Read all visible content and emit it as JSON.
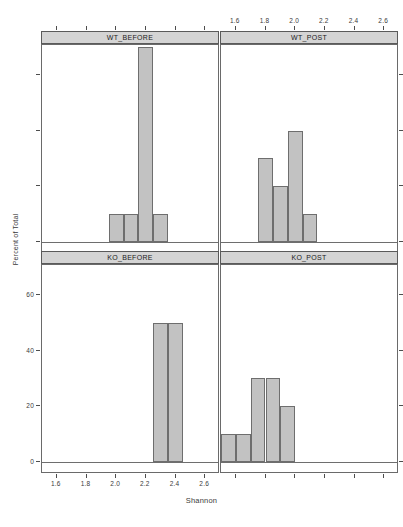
{
  "figure": {
    "xlabel": "Shannon",
    "ylabel": "Percent of Total",
    "caption": ""
  },
  "chart_data": {
    "type": "bar",
    "title": "",
    "subtitle": "",
    "xlabel": "Shannon",
    "ylabel": "Percent of Total",
    "layout": "2x2 trellis/lattice histogram panels",
    "grid": false,
    "legend": "none",
    "xlim": [
      1.5,
      2.7
    ],
    "ylim": [
      0,
      75
    ],
    "xticks": [
      "1.6",
      "1.8",
      "2.0",
      "2.2",
      "2.4",
      "2.6"
    ],
    "xtick_values": [
      1.6,
      1.8,
      2.0,
      2.2,
      2.4,
      2.6
    ],
    "yticks": [
      "0",
      "20",
      "40",
      "60"
    ],
    "ytick_values": [
      0,
      20,
      40,
      60
    ],
    "bin_width": 0.1,
    "panels": [
      {
        "name": "WT_BEFORE",
        "strip_label": "WT_BEFORE",
        "row": 0,
        "col": 0,
        "bins": [
          {
            "x0": 1.95,
            "x1": 2.05,
            "value": 10
          },
          {
            "x0": 2.05,
            "x1": 2.15,
            "value": 10
          },
          {
            "x0": 2.15,
            "x1": 2.25,
            "value": 70
          },
          {
            "x0": 2.25,
            "x1": 2.35,
            "value": 10
          }
        ]
      },
      {
        "name": "WT_POST",
        "strip_label": "WT_POST",
        "row": 0,
        "col": 1,
        "bins": [
          {
            "x0": 1.75,
            "x1": 1.85,
            "value": 30
          },
          {
            "x0": 1.85,
            "x1": 1.95,
            "value": 20
          },
          {
            "x0": 1.95,
            "x1": 2.05,
            "value": 40
          },
          {
            "x0": 2.05,
            "x1": 2.15,
            "value": 10
          }
        ]
      },
      {
        "name": "KO_BEFORE",
        "strip_label": "KO_BEFORE",
        "row": 1,
        "col": 0,
        "bins": [
          {
            "x0": 2.25,
            "x1": 2.35,
            "value": 50
          },
          {
            "x0": 2.35,
            "x1": 2.45,
            "value": 50
          }
        ]
      },
      {
        "name": "KO_POST",
        "strip_label": "KO_POST",
        "row": 1,
        "col": 1,
        "bins": [
          {
            "x0": 1.5,
            "x1": 1.6,
            "value": 10
          },
          {
            "x0": 1.6,
            "x1": 1.7,
            "value": 10
          },
          {
            "x0": 1.7,
            "x1": 1.8,
            "value": 30
          },
          {
            "x0": 1.8,
            "x1": 1.9,
            "value": 30
          },
          {
            "x0": 1.9,
            "x1": 2.0,
            "value": 20
          }
        ]
      }
    ],
    "colors": {
      "bar_fill": "#c2c2c2",
      "bar_border": "#6e6e6e",
      "strip_fill": "#d4d4d4",
      "strip_border": "#5a5a5a",
      "panel_border": "#6a6a6a",
      "text": "#3a3a3a"
    }
  }
}
